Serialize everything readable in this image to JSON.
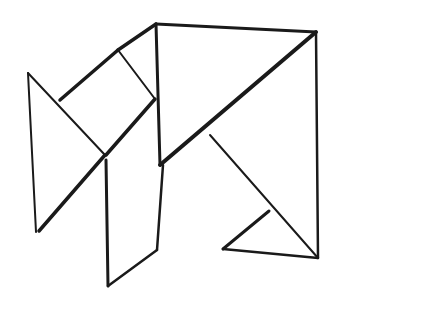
{
  "drawing": {
    "background": "#ffffff",
    "ink": "#1a1a1a",
    "description": "Hand-drawn tangram-like line sketch",
    "lines": [
      {
        "id": "left-triangle-vertical",
        "x1": 28,
        "y1": 73,
        "x2": 36,
        "y2": 232,
        "w": 2
      },
      {
        "id": "left-triangle-upper",
        "x1": 28,
        "y1": 73,
        "x2": 105,
        "y2": 155,
        "w": 2
      },
      {
        "id": "left-triangle-lower",
        "x1": 105,
        "y1": 155,
        "x2": 39,
        "y2": 231,
        "w": 3.5
      },
      {
        "id": "parallelogram-top-left",
        "x1": 60,
        "y1": 100,
        "x2": 118,
        "y2": 50,
        "w": 3.5
      },
      {
        "id": "parallelogram-top-right",
        "x1": 118,
        "y1": 50,
        "x2": 156,
        "y2": 24,
        "w": 3.5
      },
      {
        "id": "square-divider",
        "x1": 118,
        "y1": 50,
        "x2": 155,
        "y2": 99,
        "w": 2
      },
      {
        "id": "square-lower-right",
        "x1": 155,
        "y1": 99,
        "x2": 106,
        "y2": 155,
        "w": 3.5
      },
      {
        "id": "big-square-left-edge",
        "x1": 156,
        "y1": 24,
        "x2": 160,
        "y2": 165,
        "w": 3
      },
      {
        "id": "big-square-top-edge",
        "x1": 156,
        "y1": 24,
        "x2": 316,
        "y2": 32,
        "w": 3
      },
      {
        "id": "big-square-right-edge",
        "x1": 316,
        "y1": 32,
        "x2": 318,
        "y2": 258,
        "w": 2.5
      },
      {
        "id": "big-square-diagonal",
        "x1": 316,
        "y1": 32,
        "x2": 160,
        "y2": 165,
        "w": 4
      },
      {
        "id": "lower-left-piece-left",
        "x1": 106,
        "y1": 160,
        "x2": 108,
        "y2": 286,
        "w": 3
      },
      {
        "id": "lower-left-piece-right",
        "x1": 163,
        "y1": 165,
        "x2": 157,
        "y2": 250,
        "w": 2.5
      },
      {
        "id": "lower-left-piece-bottom",
        "x1": 108,
        "y1": 286,
        "x2": 157,
        "y2": 250,
        "w": 2.5
      },
      {
        "id": "inner-diagonal",
        "x1": 210,
        "y1": 135,
        "x2": 318,
        "y2": 258,
        "w": 2
      },
      {
        "id": "small-triangle-top",
        "x1": 269,
        "y1": 211,
        "x2": 223,
        "y2": 249,
        "w": 3
      },
      {
        "id": "small-triangle-bottom",
        "x1": 223,
        "y1": 249,
        "x2": 318,
        "y2": 258,
        "w": 2.5
      }
    ]
  }
}
